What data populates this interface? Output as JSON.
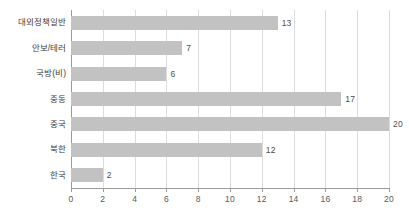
{
  "chart_data": {
    "type": "bar",
    "orientation": "horizontal",
    "title": "",
    "xlabel": "",
    "ylabel": "",
    "categories": [
      "대외정책일반",
      "안보/테러",
      "국방(비)",
      "중동",
      "중국",
      "북한",
      "한국"
    ],
    "values": [
      13,
      7,
      6,
      17,
      20,
      12,
      2
    ],
    "xlim": [
      0,
      20
    ],
    "xticks": [
      0,
      2,
      4,
      6,
      8,
      10,
      12,
      14,
      16,
      18,
      20
    ],
    "xtick_labels": [
      "0",
      "2",
      "4",
      "6",
      "8",
      "10",
      "12",
      "14",
      "16",
      "18",
      "20"
    ],
    "grid": true,
    "grid_axis": "x",
    "legend": false,
    "data_labels": [
      "13",
      "7",
      "6",
      "17",
      "20",
      "12",
      "2"
    ],
    "colors": {
      "bar": "#c2c2c2",
      "gridline": "#dcdcdc",
      "axis": "#9a9a9a",
      "label_text": "#3d3d3d",
      "value_text": "#4d4d4d",
      "tick_text": "#595959",
      "background": "#ffffff"
    }
  }
}
